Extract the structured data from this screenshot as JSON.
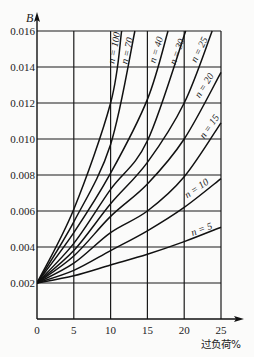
{
  "chart_data": {
    "type": "line",
    "title": "",
    "ylabel": "B",
    "xlabel": "过负荷%",
    "xlim": [
      0,
      25
    ],
    "ylim": [
      0,
      0.016
    ],
    "x_ticks": [
      0,
      5,
      10,
      15,
      20,
      25
    ],
    "x_tick_labels": [
      "0",
      "5",
      "10",
      "15",
      "20",
      "25"
    ],
    "y_ticks": [
      0.002,
      0.004,
      0.006,
      0.008,
      0.01,
      0.012,
      0.014,
      0.016
    ],
    "y_tick_labels": [
      "0.002",
      "0.004",
      "0.006",
      "0.008",
      "0.010",
      "0.012",
      "0.014",
      "0.016"
    ],
    "grid": true,
    "legend": "inline curve labels",
    "series": [
      {
        "name": "n = 5",
        "label": "n = 5",
        "points": [
          [
            0,
            0.002
          ],
          [
            5,
            0.0024
          ],
          [
            10,
            0.003
          ],
          [
            15,
            0.0036
          ],
          [
            20,
            0.0043
          ],
          [
            25,
            0.0051
          ]
        ]
      },
      {
        "name": "n = 10",
        "label": "n = 10",
        "points": [
          [
            0,
            0.002
          ],
          [
            5,
            0.0027
          ],
          [
            10,
            0.0038
          ],
          [
            15,
            0.0049
          ],
          [
            20,
            0.0062
          ],
          [
            25,
            0.0078
          ]
        ]
      },
      {
        "name": "n = 15",
        "label": "n = 15",
        "points": [
          [
            0,
            0.002
          ],
          [
            5,
            0.0031
          ],
          [
            10,
            0.0048
          ],
          [
            15,
            0.006
          ],
          [
            20,
            0.0079
          ],
          [
            25,
            0.0109
          ]
        ]
      },
      {
        "name": "n = 20",
        "label": "n = 20",
        "points": [
          [
            0,
            0.002
          ],
          [
            5,
            0.0035
          ],
          [
            10,
            0.0057
          ],
          [
            15,
            0.0075
          ],
          [
            20,
            0.01
          ],
          [
            25,
            0.0137
          ]
        ]
      },
      {
        "name": "n = 25",
        "label": "n = 25",
        "points": [
          [
            0,
            0.002
          ],
          [
            5,
            0.0038
          ],
          [
            10,
            0.0064
          ],
          [
            15,
            0.0087
          ],
          [
            20,
            0.012
          ],
          [
            23.8,
            0.016
          ]
        ]
      },
      {
        "name": "n = 30",
        "label": "n = 30",
        "points": [
          [
            0,
            0.002
          ],
          [
            5,
            0.0042
          ],
          [
            10,
            0.0072
          ],
          [
            15,
            0.0099
          ],
          [
            20.2,
            0.016
          ]
        ]
      },
      {
        "name": "n = 40",
        "label": "n = 40",
        "points": [
          [
            0,
            0.002
          ],
          [
            5,
            0.0048
          ],
          [
            10,
            0.0081
          ],
          [
            15,
            0.0122
          ],
          [
            17.8,
            0.016
          ]
        ]
      },
      {
        "name": "n = 70",
        "label": "n = 70",
        "points": [
          [
            0,
            0.002
          ],
          [
            5,
            0.0054
          ],
          [
            10,
            0.0097
          ],
          [
            13.3,
            0.016
          ]
        ]
      },
      {
        "name": "n = 100",
        "label": "n = 100",
        "points": [
          [
            0,
            0.002
          ],
          [
            5,
            0.0061
          ],
          [
            10,
            0.012
          ],
          [
            11.5,
            0.016
          ]
        ]
      }
    ],
    "label_layout": [
      {
        "series": "n = 5",
        "cx": 202,
        "cy": 230,
        "rot": -20
      },
      {
        "series": "n = 10",
        "cx": 197,
        "cy": 189,
        "rot": -34
      },
      {
        "series": "n = 15",
        "cx": 210,
        "cy": 127,
        "rot": -55
      },
      {
        "series": "n = 20",
        "cx": 205,
        "cy": 86,
        "rot": -58
      },
      {
        "series": "n = 25",
        "cx": 200,
        "cy": 50,
        "rot": -64
      },
      {
        "series": "n = 30",
        "cx": 178,
        "cy": 52,
        "rot": -70
      },
      {
        "series": "n = 40",
        "cx": 157,
        "cy": 50,
        "rot": -73
      },
      {
        "series": "n = 70",
        "cx": 128,
        "cy": 51,
        "rot": -77
      },
      {
        "series": "n = 100",
        "cx": 115,
        "cy": 48,
        "rot": -79
      }
    ]
  },
  "colors": {
    "background": "#fbfbfa",
    "ink": "#111111"
  }
}
